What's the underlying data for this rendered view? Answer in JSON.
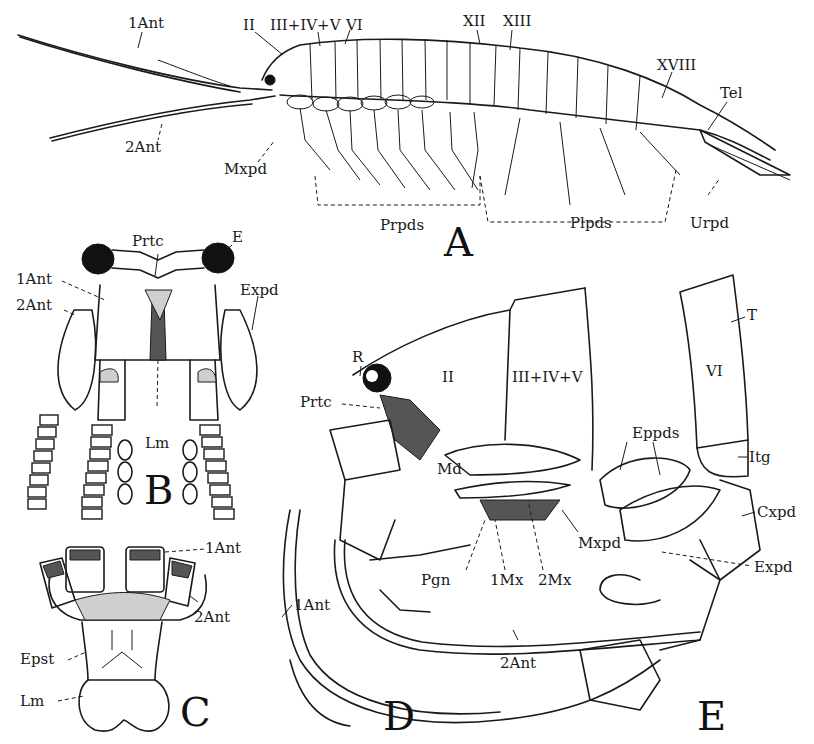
{
  "figure": {
    "panels": [
      {
        "id": "A",
        "label": "A",
        "view": "whole animal, lateral"
      },
      {
        "id": "B",
        "label": "B",
        "view": "head, ventral"
      },
      {
        "id": "C",
        "label": "C",
        "view": "epistome and antennal bases"
      },
      {
        "id": "D",
        "label": "D",
        "view": "head region, lateral"
      },
      {
        "id": "E",
        "label": "E",
        "view": "thoracic segment VI with leg"
      }
    ],
    "labels": {
      "A": {
        "ant1": "1Ant",
        "ant2": "2Ant",
        "seg_II": "II",
        "seg_III_V": "III+IV+V",
        "seg_VI": "VI",
        "seg_XII": "XII",
        "seg_XIII": "XIII",
        "seg_XVIII": "XVIII",
        "telson": "Tel",
        "maxilliped": "Mxpd",
        "pereiopods": "Prpds",
        "pleopods": "Plpds",
        "uropod": "Urpd"
      },
      "B": {
        "protocerebrum": "Prtc",
        "eye": "E",
        "ant1": "1Ant",
        "ant2": "2Ant",
        "exopodite": "Expd",
        "labrum": "Lm"
      },
      "C": {
        "ant1": "1Ant",
        "ant2": "2Ant",
        "epistome": "Epst",
        "labrum": "Lm"
      },
      "D": {
        "rostrum": "R",
        "protocerebrum": "Prtc",
        "seg_II": "II",
        "seg_III_V": "III+IV+V",
        "mandible": "Md",
        "paragnath": "Pgn",
        "maxilla1": "1Mx",
        "maxilla2": "2Mx",
        "maxilliped": "Mxpd",
        "ant1": "1Ant",
        "ant2": "2Ant"
      },
      "E": {
        "tergum": "T",
        "seg_VI": "VI",
        "epipodites": "Eppds",
        "intertergal": "Itg",
        "coxopodite": "Cxpd",
        "exopodite": "Expd"
      }
    },
    "colors": {
      "ink": "#1a1a1a",
      "paper": "#ffffff"
    }
  }
}
